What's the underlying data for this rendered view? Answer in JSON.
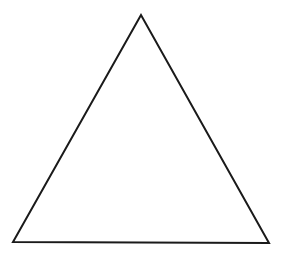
{
  "diagram": {
    "shape": "triangle",
    "type": "isosceles-triangle",
    "vertices": {
      "apex": [
        141,
        15
      ],
      "bottom_left": [
        13,
        242
      ],
      "bottom_right": [
        269,
        243
      ]
    },
    "stroke_color": "#1a1a1a",
    "fill_color": "#ffffff",
    "background_color": "#ffffff",
    "stroke_width": 2
  }
}
